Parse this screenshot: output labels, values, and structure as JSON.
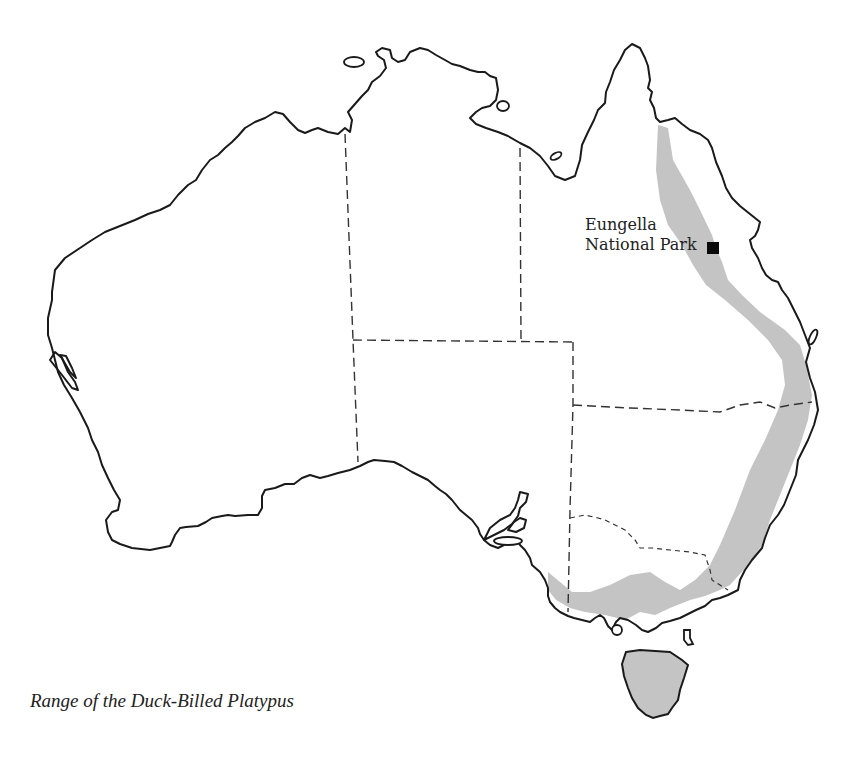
{
  "map": {
    "title": "Range of the Duck-Billed Platypus",
    "subject": "Australia",
    "range_fill_color": "#c4c4c4",
    "outline_color": "#1a1a1a",
    "range_regions": [
      "Eastern coastal Australia (Queensland to South Australia)",
      "Tasmania"
    ],
    "markers": [
      {
        "label_line1": "Eungella",
        "label_line2": "National Park",
        "symbol": "black-square"
      }
    ]
  }
}
